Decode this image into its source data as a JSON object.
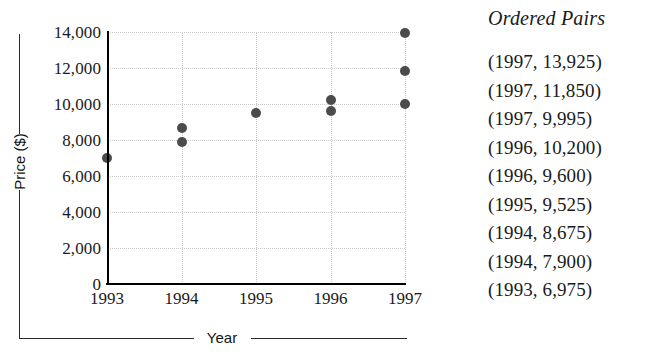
{
  "chart_data": {
    "type": "scatter",
    "title": "",
    "xlabel": "Year",
    "ylabel": "Price ($)",
    "xlim": [
      1993,
      1997
    ],
    "ylim": [
      0,
      14000
    ],
    "grid": true,
    "legend": "none",
    "x_ticks": [
      "1993",
      "1994",
      "1995",
      "1996",
      "1997"
    ],
    "y_ticks": [
      "0",
      "2,000",
      "4,000",
      "6,000",
      "8,000",
      "10,000",
      "12,000",
      "14,000"
    ],
    "y_tick_values": [
      0,
      2000,
      4000,
      6000,
      8000,
      10000,
      12000,
      14000
    ],
    "point_color": "#4b4b4b",
    "points": [
      {
        "x": 1993,
        "y": 6975
      },
      {
        "x": 1994,
        "y": 7900
      },
      {
        "x": 1994,
        "y": 8675
      },
      {
        "x": 1995,
        "y": 9525
      },
      {
        "x": 1996,
        "y": 9600
      },
      {
        "x": 1996,
        "y": 10200
      },
      {
        "x": 1997,
        "y": 9995
      },
      {
        "x": 1997,
        "y": 11850
      },
      {
        "x": 1997,
        "y": 13925
      }
    ]
  },
  "pairs_panel": {
    "title": "Ordered Pairs",
    "pairs": [
      "(1997, 13,925)",
      "(1997, 11,850)",
      "(1997, 9,995)",
      "(1996, 10,200)",
      "(1996, 9,600)",
      "(1995, 9,525)",
      "(1994, 8,675)",
      "(1994, 7,900)",
      "(1993, 6,975)"
    ]
  }
}
